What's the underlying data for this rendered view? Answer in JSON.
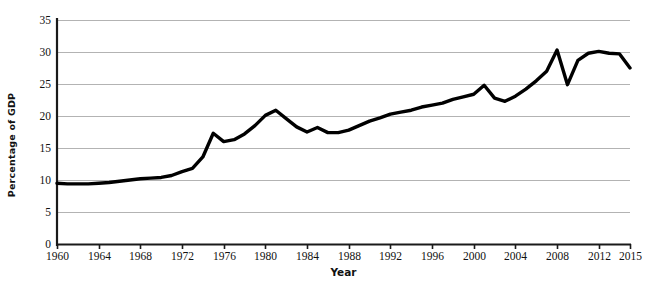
{
  "chart_data": {
    "type": "line",
    "title": "",
    "xlabel": "Year",
    "ylabel": "Percentage of GDP",
    "xlim": [
      1960,
      2015
    ],
    "ylim": [
      0,
      35
    ],
    "grid": true,
    "legend": false,
    "line_color": "#000000",
    "grid_color": "#b3b3b3",
    "axis_color": "#1a1a1a",
    "background_color": "#ffffff",
    "y_ticks": [
      0,
      5,
      10,
      15,
      20,
      25,
      30,
      35
    ],
    "y_tick_labels": [
      "0",
      "5",
      "10",
      "15",
      "20",
      "25",
      "30",
      "35"
    ],
    "x_ticks": [
      1960,
      1964,
      1968,
      1972,
      1976,
      1980,
      1984,
      1988,
      1992,
      1996,
      2000,
      2004,
      2008,
      2012,
      2015
    ],
    "x_tick_labels": [
      "1960",
      "1964",
      "1968",
      "1972",
      "1976",
      "1980",
      "1984",
      "1988",
      "1992",
      "1996",
      "2000",
      "2004",
      "2008",
      "2012",
      "2015"
    ],
    "x": [
      1960,
      1961,
      1962,
      1963,
      1964,
      1965,
      1966,
      1967,
      1968,
      1969,
      1970,
      1971,
      1972,
      1973,
      1974,
      1975,
      1976,
      1977,
      1978,
      1979,
      1980,
      1981,
      1982,
      1983,
      1984,
      1985,
      1986,
      1987,
      1988,
      1989,
      1990,
      1991,
      1992,
      1993,
      1994,
      1995,
      1996,
      1997,
      1998,
      1999,
      2000,
      2001,
      2002,
      2003,
      2004,
      2005,
      2006,
      2007,
      2008,
      2009,
      2010,
      2011,
      2012,
      2013,
      2014,
      2015
    ],
    "values": [
      9.5,
      9.4,
      9.4,
      9.4,
      9.5,
      9.6,
      9.8,
      10.0,
      10.2,
      10.3,
      10.4,
      10.7,
      11.3,
      11.8,
      13.6,
      17.3,
      16.0,
      16.3,
      17.2,
      18.5,
      20.1,
      20.9,
      19.6,
      18.3,
      17.5,
      18.2,
      17.4,
      17.4,
      17.8,
      18.5,
      19.2,
      19.7,
      20.3,
      20.6,
      20.9,
      21.4,
      21.7,
      22.0,
      22.6,
      23.0,
      23.4,
      24.8,
      22.8,
      22.3,
      23.1,
      24.2,
      25.5,
      27.0,
      30.3,
      24.9,
      28.7,
      29.8,
      30.1,
      29.8,
      29.7,
      27.5
    ]
  },
  "axes": {
    "y_axis_title": "Percentage of GDP",
    "x_axis_title": "Year"
  }
}
